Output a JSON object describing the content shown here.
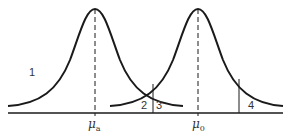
{
  "diagram": {
    "type": "two overlapping normal distributions (hypothesis test regions)",
    "colors": {
      "stroke": "#1a1a1a",
      "text": "#333333",
      "background": "#ffffff"
    },
    "curves": [
      {
        "name": "alternative-distribution",
        "mean_label": "μ",
        "mean_sub": "a"
      },
      {
        "name": "null-distribution",
        "mean_label": "μ",
        "mean_sub": "0"
      }
    ],
    "region_labels": [
      "1",
      "2",
      "3",
      "4"
    ]
  }
}
